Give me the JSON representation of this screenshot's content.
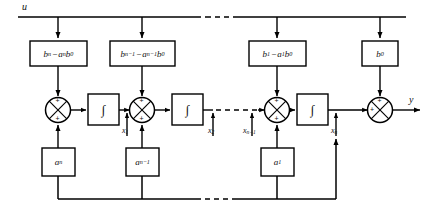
{
  "figure": {
    "kind": "block-diagram"
  },
  "signals": {
    "input_label": "u",
    "output_label": "y",
    "states": [
      {
        "name": "x1",
        "text": "x",
        "sub": "1"
      },
      {
        "name": "x2",
        "text": "x",
        "sub": "2"
      },
      {
        "name": "xn_1",
        "text": "x",
        "sub": "n−1"
      },
      {
        "name": "xn",
        "text": "x",
        "sub": "n"
      }
    ]
  },
  "feedforward_blocks": [
    {
      "name": "b-n-minus-a-n-b0",
      "lead": "b",
      "lead_sub": "n",
      "op": "−",
      "tail": "a",
      "tail_sub": "n",
      "tail2": "b",
      "tail2_sub": "0"
    },
    {
      "name": "b-n1-minus-a-n1-b0",
      "lead": "b",
      "lead_sub": "n−1",
      "op": "−",
      "tail": "a",
      "tail_sub": "n−1",
      "tail2": "b",
      "tail2_sub": "0"
    },
    {
      "name": "b-1-minus-a-1-b0",
      "lead": "b",
      "lead_sub": "1",
      "op": "−",
      "tail": "a",
      "tail_sub": "1",
      "tail2": "b",
      "tail2_sub": "0"
    },
    {
      "name": "b0",
      "lead": "b",
      "lead_sub": "0",
      "op": "",
      "tail": "",
      "tail_sub": "",
      "tail2": "",
      "tail2_sub": ""
    }
  ],
  "feedback_blocks": [
    {
      "name": "a-n",
      "text": "a",
      "sub": "n"
    },
    {
      "name": "a-n-minus-1",
      "text": "a",
      "sub": "n−1"
    },
    {
      "name": "a-1",
      "text": "a",
      "sub": "1"
    }
  ],
  "integrators": [
    {
      "name": "integrator-1",
      "glyph": "∫"
    },
    {
      "name": "integrator-2",
      "glyph": "∫"
    },
    {
      "name": "integrator-n",
      "glyph": "∫"
    }
  ],
  "summing_junctions": [
    {
      "name": "sum-1",
      "signs": [
        "+",
        "+"
      ]
    },
    {
      "name": "sum-2",
      "signs": [
        "+",
        "+"
      ]
    },
    {
      "name": "sum-n",
      "signs": [
        "+",
        "+"
      ]
    },
    {
      "name": "sum-output",
      "signs": [
        "+",
        "+"
      ]
    }
  ],
  "colors": {
    "line": "#000000",
    "block_border": "#000000",
    "background": "#ffffff"
  }
}
